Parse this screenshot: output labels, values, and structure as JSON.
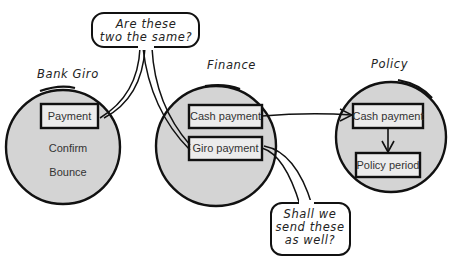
{
  "diagram": {
    "contexts": [
      {
        "id": "bank-giro",
        "label": "Bank Giro",
        "boxed_items": [
          "Payment"
        ],
        "plain_items": [
          "Confirm",
          "Bounce"
        ]
      },
      {
        "id": "finance",
        "label": "Finance",
        "boxed_items": [
          "Cash payment",
          "Giro payment"
        ],
        "plain_items": []
      },
      {
        "id": "policy",
        "label": "Policy",
        "boxed_items": [
          "Cash payment",
          "Policy period"
        ],
        "plain_items": []
      }
    ],
    "callouts": [
      {
        "id": "same-question",
        "lines": [
          "Are these",
          "two the same?"
        ]
      },
      {
        "id": "send-question",
        "lines": [
          "Shall we",
          "send these",
          "as well?"
        ]
      }
    ],
    "relations": [
      {
        "from": "Finance.Cash payment",
        "to": "Policy.Cash payment",
        "type": "arrow"
      },
      {
        "from": "Policy.Cash payment",
        "to": "Policy.Policy period",
        "type": "arrow"
      }
    ],
    "colors": {
      "circle_fill": "#d4d4d4",
      "box_fill": "#ececec",
      "stroke": "#111111",
      "text": "#333333"
    }
  }
}
